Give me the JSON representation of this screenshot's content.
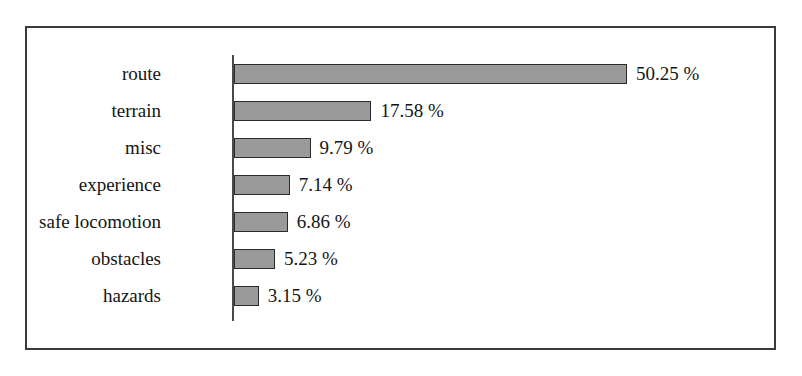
{
  "chart_data": {
    "type": "bar",
    "orientation": "horizontal",
    "title": "",
    "subtitle": "",
    "xlabel": "",
    "ylabel": "",
    "xlim": [
      0,
      55
    ],
    "grid": false,
    "legend": null,
    "unit": "%",
    "categories": [
      "route",
      "terrain",
      "misc",
      "experience",
      "safe locomotion",
      "obstacles",
      "hazards"
    ],
    "values": [
      50.25,
      17.58,
      9.79,
      7.14,
      6.86,
      5.23,
      3.15
    ],
    "data_labels": [
      "50.25 %",
      "17.58 %",
      "9.79 %",
      "7.14 %",
      "6.86 %",
      "5.23 %",
      "3.15 %"
    ],
    "bars": [
      {
        "category": "route",
        "value": 50.25,
        "label": "50.25 %"
      },
      {
        "category": "terrain",
        "value": 17.58,
        "label": "17.58 %"
      },
      {
        "category": "misc",
        "value": 9.79,
        "label": "9.79 %"
      },
      {
        "category": "experience",
        "value": 7.14,
        "label": "7.14 %"
      },
      {
        "category": "safe locomotion",
        "value": 6.86,
        "label": "6.86 %"
      },
      {
        "category": "obstacles",
        "value": 5.23,
        "label": "5.23 %"
      },
      {
        "category": "hazards",
        "value": 3.15,
        "label": "3.15 %"
      }
    ],
    "colors": {
      "bar_fill": "#9a9a9a",
      "bar_border": "#2b2b2b",
      "axis_line": "#4a4a4a",
      "frame_border": "#3a3a3a",
      "background": "#ffffff",
      "text": "#151515"
    }
  }
}
